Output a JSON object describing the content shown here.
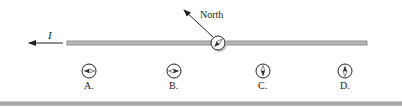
{
  "diagram": {
    "wire": {
      "x1": 67,
      "x2": 367,
      "y": 43,
      "color": "#b8b8b8",
      "outline": "#7a7a7a"
    },
    "current": {
      "label": "I",
      "direction": "left",
      "arrow_from_x": 63,
      "arrow_to_x": 28,
      "y": 43
    },
    "reference_compass": {
      "cx": 218,
      "cy": 43,
      "r": 7,
      "needle_direction": "northwest"
    },
    "north_indicator": {
      "label": "North",
      "arrow_from": [
        213,
        37
      ],
      "arrow_to": [
        183,
        9
      ]
    },
    "options": [
      {
        "label": "A.",
        "cx": 89,
        "cy": 71,
        "needle": "horizontal",
        "north_end": "left"
      },
      {
        "label": "B.",
        "cx": 174,
        "cy": 71,
        "needle": "horizontal",
        "north_end": "right"
      },
      {
        "label": "C.",
        "cx": 263,
        "cy": 71,
        "needle": "vertical",
        "north_end": "bottom"
      },
      {
        "label": "D.",
        "cx": 345,
        "cy": 71,
        "needle": "vertical",
        "north_end": "top"
      }
    ],
    "colors": {
      "ink": "#222222",
      "needle_dark": "#333333",
      "needle_light": "#ffffff",
      "compass_shadow": "#c9c9c9"
    }
  }
}
